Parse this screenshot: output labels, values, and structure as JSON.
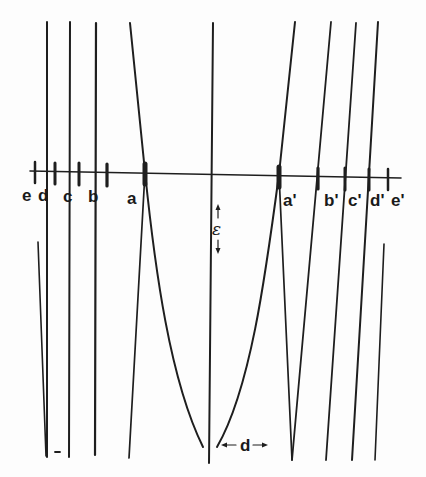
{
  "diagram": {
    "axis_labels_left": [
      "e",
      "d",
      "c",
      "b",
      "a"
    ],
    "axis_labels_right": [
      "a'",
      "b'",
      "c'",
      "d'",
      "e'"
    ],
    "vertical_gap_label": "ε",
    "horizontal_gap_label": "d",
    "small_mark": "-",
    "ink_color": "#1e1e1e",
    "background_color": "#fdfdfd"
  }
}
